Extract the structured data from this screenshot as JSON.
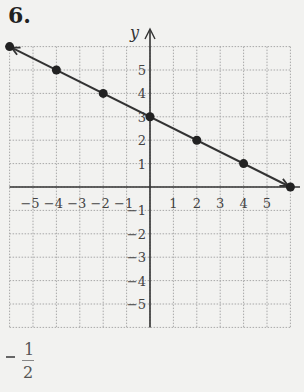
{
  "problem": {
    "number": "6."
  },
  "answer": {
    "sign": "−",
    "numerator": "1",
    "denominator": "2"
  },
  "chart_data": {
    "type": "line",
    "title": "",
    "xlabel": "x",
    "ylabel": "y",
    "xlim": [
      -6,
      6
    ],
    "ylim": [
      -6,
      6
    ],
    "grid": true,
    "x_ticks": [
      "−5",
      "−4",
      "−3",
      "−2",
      "−1",
      "1",
      "2",
      "3",
      "4",
      "5"
    ],
    "y_ticks": [
      "5",
      "4",
      "3",
      "2",
      "1",
      "−1",
      "−2",
      "−3",
      "−4",
      "−5"
    ],
    "series": [
      {
        "name": "line",
        "equation": "y = -1/2 x + 3",
        "points": [
          [
            -6,
            6
          ],
          [
            -4,
            5
          ],
          [
            -2,
            4
          ],
          [
            0,
            3
          ],
          [
            2,
            2
          ],
          [
            4,
            1
          ],
          [
            6,
            0
          ]
        ],
        "arrows_both_ends": true
      }
    ],
    "colors": {
      "line": "#333333",
      "grid": "#a8a8a8",
      "axis": "#333333"
    }
  }
}
